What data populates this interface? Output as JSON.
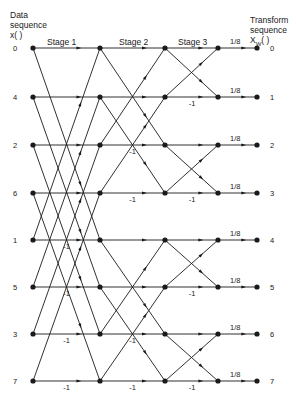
{
  "left_header": {
    "line1": "Data",
    "line2": "sequence",
    "line3": "x( )"
  },
  "right_header": {
    "line1": "Transform",
    "line2": "sequence",
    "line3": "X",
    "sub": "W",
    "line3b": "( )"
  },
  "stages": [
    "Stage 1",
    "Stage 2",
    "Stage 3"
  ],
  "input_indices": [
    "0",
    "4",
    "2",
    "6",
    "1",
    "5",
    "3",
    "7"
  ],
  "output_indices": [
    "0",
    "1",
    "2",
    "3",
    "4",
    "5",
    "6",
    "7"
  ],
  "scale_label": "1/8",
  "neg_label": "-1",
  "colors": {
    "line": "#1a1a1a",
    "bg": "#ffffff"
  },
  "geometry": {
    "cols": [
      33,
      100,
      165,
      218,
      257
    ],
    "rows": [
      48,
      97,
      145,
      193,
      240,
      287,
      334,
      381
    ]
  },
  "stage1_pairs": [
    [
      0,
      4
    ],
    [
      1,
      5
    ],
    [
      2,
      6
    ],
    [
      3,
      7
    ]
  ],
  "stage2_pairs": [
    [
      0,
      2
    ],
    [
      1,
      3
    ],
    [
      4,
      6
    ],
    [
      5,
      7
    ]
  ],
  "stage3_pairs": [
    [
      0,
      1
    ],
    [
      2,
      3
    ],
    [
      4,
      5
    ],
    [
      6,
      7
    ]
  ],
  "neg_stage1_rows": [
    4,
    5,
    6,
    7
  ],
  "neg_stage2_rows": [
    2,
    3,
    6,
    7
  ],
  "neg_stage3_rows": [
    1,
    3,
    5,
    7
  ]
}
